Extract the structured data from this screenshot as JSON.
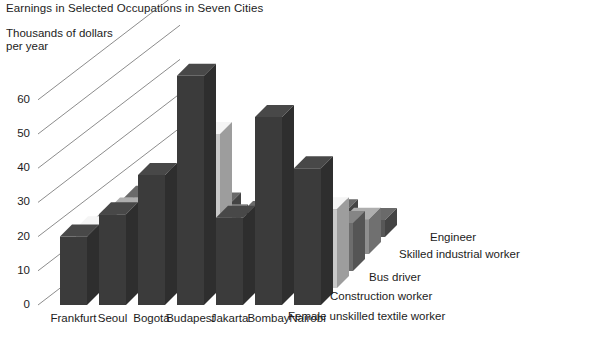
{
  "chart_data": {
    "type": "bar",
    "subtype": "3d-grouped-bar",
    "title": "Earnings in Selected Occupations in Seven Cities",
    "ylabel": "Thousands of dollars\nper year",
    "xlabel": "",
    "categories": [
      "Frankfurt",
      "Seoul",
      "Bogotá",
      "Budapest",
      "Jakarta",
      "Bombay",
      "Nairobi"
    ],
    "ylim": [
      0,
      60
    ],
    "yticks": [
      0,
      10,
      20,
      30,
      40,
      50,
      60
    ],
    "ytick_labels": [
      "0",
      "10",
      "20",
      "30",
      "40",
      "50",
      "60"
    ],
    "grid": true,
    "legend_position": "right-inline",
    "series": [
      {
        "name": "Engineer",
        "color": "#3b3b3b",
        "values": [
          20.0,
          26.5,
          38.0,
          67.0,
          25.5,
          55.0,
          40.0
        ]
      },
      {
        "name": "Skilled industrial worker",
        "color": "#c9c9c9",
        "values": [
          17.5,
          21.0,
          22.0,
          45.0,
          18.0,
          21.0,
          23.0
        ]
      },
      {
        "name": "Bus driver",
        "color": "#6d6d6d",
        "values": [
          14.5,
          14.0,
          14.0,
          16.0,
          9.0,
          13.0,
          14.0
        ]
      },
      {
        "name": "Construction worker",
        "color": "#8f8f8f",
        "values": [
          13.0,
          11.0,
          11.5,
          10.5,
          5.5,
          9.0,
          10.0
        ]
      },
      {
        "name": "Female unskilled textile worker",
        "color": "#575757",
        "values": [
          11.5,
          9.5,
          9.5,
          7.0,
          2.0,
          7.5,
          5.0
        ]
      }
    ]
  },
  "legend": {
    "items": [
      {
        "label": "Engineer"
      },
      {
        "label": "Skilled industrial worker"
      },
      {
        "label": "Bus driver"
      },
      {
        "label": "Construction worker"
      },
      {
        "label": "Female unskilled textile worker"
      }
    ]
  }
}
